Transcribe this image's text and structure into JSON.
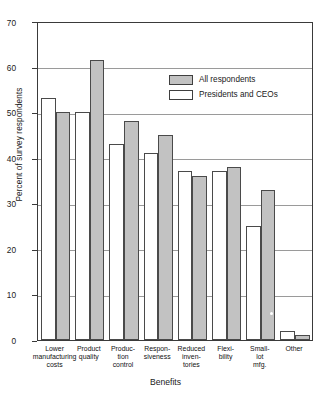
{
  "chart_data": {
    "type": "bar",
    "title": "",
    "xlabel": "Benefits",
    "ylabel": "Percent of survey respondents",
    "ylim": [
      0,
      70
    ],
    "ytick_values": [
      0,
      10,
      20,
      30,
      40,
      50,
      60,
      70
    ],
    "ytick_labels": [
      "0",
      "10",
      "20",
      "30",
      "40",
      "50",
      "60",
      "70"
    ],
    "grid": "horizontal",
    "legend_position": "upper right",
    "categories": [
      "Lower manufacturing costs",
      "Product quality",
      "Production control",
      "Responsiveness",
      "Reduced inventories",
      "Flexibility",
      "Small-lot mfg.",
      "Other"
    ],
    "category_label_lines": [
      [
        "Lower",
        "manufacturing",
        "costs"
      ],
      [
        "Product",
        "quality"
      ],
      [
        "Produc-",
        "tion",
        "control"
      ],
      [
        "Respon-",
        "siveness"
      ],
      [
        "Reduced",
        "inven-",
        "tories"
      ],
      [
        "Flexi-",
        "bility"
      ],
      [
        "Small-",
        "lot",
        "mfg."
      ],
      [
        "Other"
      ]
    ],
    "series": [
      {
        "name": "Presidents and CEOs",
        "color": "#ffffff",
        "values": [
          53,
          50,
          43,
          41,
          37,
          37,
          25,
          2
        ]
      },
      {
        "name": "All respondents",
        "color": "#c2c2c2",
        "values": [
          50,
          61.5,
          48,
          45,
          36,
          38,
          33,
          1.2
        ]
      }
    ],
    "legend_entries": [
      {
        "label": "All respondents",
        "swatch": "gray"
      },
      {
        "label": "Presidents and CEOs",
        "swatch": "white"
      }
    ]
  }
}
